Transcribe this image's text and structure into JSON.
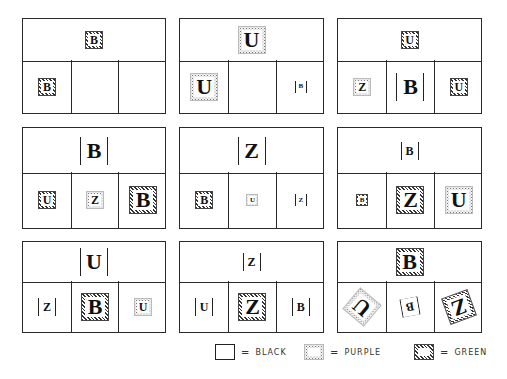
{
  "figure": {
    "panels": [
      {
        "id": 1,
        "top": {
          "letter": "B",
          "frame": "green",
          "size": "small"
        },
        "bottom": [
          {
            "letter": "B",
            "frame": "green",
            "size": "small"
          },
          {
            "letter": "",
            "frame": "none"
          },
          {
            "letter": "",
            "frame": "none"
          }
        ]
      },
      {
        "id": 2,
        "top": {
          "letter": "U",
          "frame": "purple",
          "size": "large"
        },
        "bottom": [
          {
            "letter": "U",
            "frame": "purple",
            "size": "large"
          },
          {
            "letter": "",
            "frame": "none"
          },
          {
            "letter": "B",
            "frame": "black",
            "size": "tiny"
          }
        ]
      },
      {
        "id": 3,
        "top": {
          "letter": "U",
          "frame": "green",
          "size": "small"
        },
        "bottom": [
          {
            "letter": "Z",
            "frame": "purple",
            "size": "small"
          },
          {
            "letter": "B",
            "frame": "black",
            "size": "large"
          },
          {
            "letter": "U",
            "frame": "green",
            "size": "small"
          }
        ]
      },
      {
        "id": 4,
        "top": {
          "letter": "B",
          "frame": "black",
          "size": "large"
        },
        "bottom": [
          {
            "letter": "U",
            "frame": "green",
            "size": "small"
          },
          {
            "letter": "Z",
            "frame": "purple",
            "size": "small"
          },
          {
            "letter": "B",
            "frame": "green",
            "size": "large"
          }
        ]
      },
      {
        "id": 5,
        "top": {
          "letter": "Z",
          "frame": "black",
          "size": "large"
        },
        "bottom": [
          {
            "letter": "B",
            "frame": "green",
            "size": "small"
          },
          {
            "letter": "U",
            "frame": "purple",
            "size": "tiny"
          },
          {
            "letter": "Z",
            "frame": "black",
            "size": "tiny"
          }
        ]
      },
      {
        "id": 6,
        "top": {
          "letter": "B",
          "frame": "black",
          "size": "small"
        },
        "bottom": [
          {
            "letter": "B",
            "frame": "green",
            "size": "tiny"
          },
          {
            "letter": "Z",
            "frame": "green",
            "size": "large"
          },
          {
            "letter": "U",
            "frame": "purple",
            "size": "large"
          }
        ]
      },
      {
        "id": 7,
        "top": {
          "letter": "U",
          "frame": "black",
          "size": "large"
        },
        "bottom": [
          {
            "letter": "Z",
            "frame": "black",
            "size": "small"
          },
          {
            "letter": "B",
            "frame": "green",
            "size": "large"
          },
          {
            "letter": "U",
            "frame": "purple",
            "size": "small"
          }
        ]
      },
      {
        "id": 8,
        "top": {
          "letter": "Z",
          "frame": "black",
          "size": "small"
        },
        "bottom": [
          {
            "letter": "U",
            "frame": "black",
            "size": "small"
          },
          {
            "letter": "Z",
            "frame": "green",
            "size": "large"
          },
          {
            "letter": "B",
            "frame": "black",
            "size": "small"
          }
        ]
      },
      {
        "id": 9,
        "top": {
          "letter": "B",
          "frame": "green",
          "size": "large"
        },
        "bottom": [
          {
            "letter": "U",
            "frame": "purple",
            "size": "large",
            "rotation": -140
          },
          {
            "letter": "B",
            "frame": "black",
            "size": "small",
            "rotation": 170
          },
          {
            "letter": "Z",
            "frame": "green",
            "size": "large",
            "rotation": 160
          }
        ]
      }
    ]
  },
  "legend": {
    "items": [
      {
        "frame": "black",
        "equals": "=",
        "label": "BLACK"
      },
      {
        "frame": "purple",
        "equals": "=",
        "label": "PURPLE"
      },
      {
        "frame": "green",
        "equals": "=",
        "label": "GREEN"
      }
    ]
  }
}
